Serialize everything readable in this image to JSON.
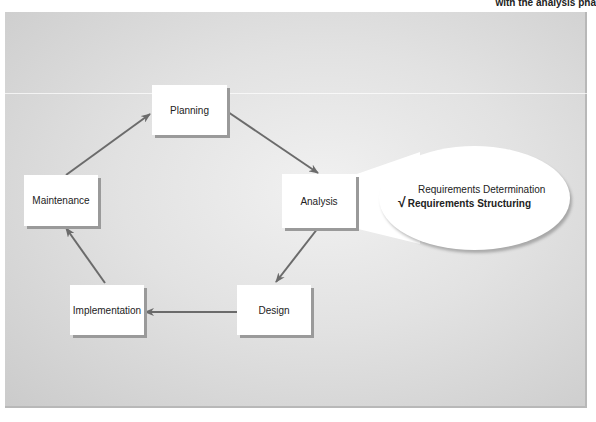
{
  "caption": "with the analysis pha",
  "diagram": {
    "nodes": {
      "planning": "Planning",
      "analysis": "Analysis",
      "design": "Design",
      "implementation": "Implementation",
      "maintenance": "Maintenance"
    },
    "flow": [
      "Planning",
      "Analysis",
      "Design",
      "Implementation",
      "Maintenance",
      "Planning"
    ],
    "callout": {
      "attached_to": "Analysis",
      "items": [
        {
          "label": "Requirements Determination",
          "checked": false
        },
        {
          "label": "Requirements Structuring",
          "checked": true
        }
      ],
      "check_glyph": "√"
    },
    "colors": {
      "arrow": "#6b6b6b",
      "box": "#ffffff",
      "panel": "#d9d9d9"
    }
  }
}
